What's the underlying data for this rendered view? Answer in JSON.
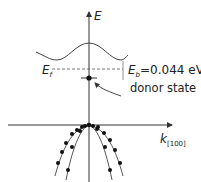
{
  "diagram": {
    "type": "band-structure",
    "axes": {
      "vertical_label": "E",
      "horizontal_label_main": "k",
      "horizontal_label_sub": "[100]"
    },
    "labels": {
      "fermi_main": "E",
      "fermi_sub": "f",
      "binding_main": "E",
      "binding_sub": "b",
      "binding_value": "=0.044 eV",
      "donor_state": "donor state"
    },
    "colors": {
      "line": "#333333",
      "dots": "#111111"
    },
    "valence_dots": {
      "outer_left": [
        [
          82,
          127
        ],
        [
          77,
          130
        ],
        [
          72,
          134
        ],
        [
          66,
          143
        ],
        [
          62,
          152
        ],
        [
          58,
          163
        ]
      ],
      "inner_left": [
        [
          85,
          126
        ],
        [
          80,
          131
        ],
        [
          72,
          147
        ],
        [
          68,
          170
        ]
      ],
      "inner_right": [
        [
          93,
          126
        ],
        [
          97,
          129
        ],
        [
          105,
          147
        ],
        [
          110,
          170
        ]
      ],
      "outer_right": [
        [
          98,
          127
        ],
        [
          104,
          133
        ],
        [
          110,
          140
        ],
        [
          115,
          150
        ],
        [
          120,
          163
        ]
      ],
      "apex": [
        89,
        125
      ]
    }
  }
}
